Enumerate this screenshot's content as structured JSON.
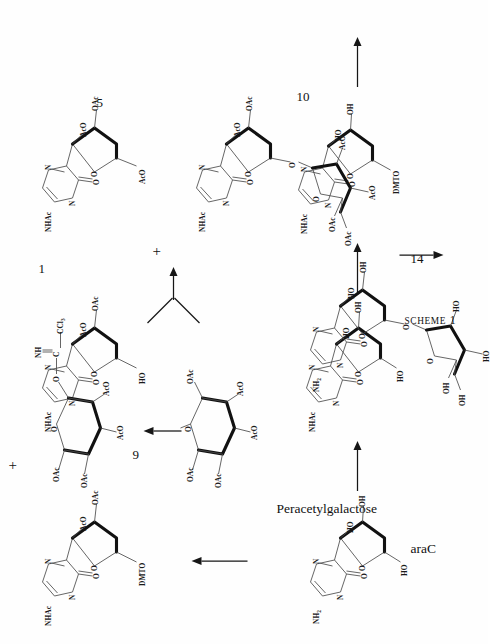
{
  "figure": {
    "caption_small_caps": "SCHEME",
    "caption_number": "1",
    "caption_full": "Scheme 1"
  },
  "compounds": [
    {
      "id": "araC",
      "label": "araC",
      "number": "",
      "base": "cytosine",
      "base_substituent": "NH2",
      "sugar_labels": [
        "HO",
        "OH",
        "HO"
      ]
    },
    {
      "id": "n-acetyl-araC",
      "label": "",
      "number": "",
      "base": "N-acetylcytosine",
      "base_substituent": "NHAc",
      "sugar_labels": [
        "HO",
        "OH",
        "HO"
      ]
    },
    {
      "id": "dmt-n-acetyl-araC",
      "label": "",
      "number": "",
      "base": "N-acetylcytosine",
      "base_substituent": "NHAc",
      "sugar_labels": [
        "HO",
        "OH",
        "DMTO"
      ]
    },
    {
      "id": "diacetyl-dmt",
      "label": "",
      "number": "",
      "base": "N-acetylcytosine",
      "base_substituent": "NHAc",
      "sugar_labels": [
        "AcO",
        "OAc",
        "DMTO"
      ]
    },
    {
      "id": "compound-1",
      "label": "",
      "number": "1",
      "base": "N-acetylcytosine",
      "base_substituent": "NHAc",
      "sugar_labels": [
        "AcO",
        "OAc",
        "HO"
      ]
    },
    {
      "id": "peracetylgalactose",
      "label": "Peracetylgalactose",
      "number": "",
      "sugar_labels": [
        "OAc",
        "OAc",
        "OAc",
        "AcO",
        "AcO"
      ]
    },
    {
      "id": "compound-9",
      "label": "",
      "number": "9",
      "sugar_labels": [
        "OAc",
        "OAc",
        "AcO",
        "AcO"
      ],
      "imidate": {
        "o": "O",
        "c": "C",
        "nh": "NH",
        "ccl3": "CCl3"
      }
    },
    {
      "id": "compound-5",
      "label": "",
      "number": "5",
      "base": "N-acetylcytosine",
      "base_substituent": "NHAc",
      "sugar_labels": [
        "AcO",
        "OAc",
        "AcO"
      ]
    },
    {
      "id": "compound-10",
      "label": "",
      "number": "10",
      "base": "N-acetylcytosine",
      "base_substituent": "NHAc",
      "sugar_labels": [
        "AcO",
        "OAc",
        "O",
        "AcO",
        "OAc",
        "OAc",
        "AcO"
      ]
    },
    {
      "id": "compound-14",
      "label": "",
      "number": "14",
      "base": "cytosine",
      "base_substituent": "NH2",
      "sugar_labels": [
        "HO",
        "OH",
        "O",
        "HO",
        "OH",
        "OH",
        "HO"
      ]
    }
  ],
  "atom_labels": {
    "nh2": "NH",
    "nh2_sub": "2",
    "nhac": "NHAc",
    "n": "N",
    "o": "O",
    "ho": "HO",
    "oh": "OH",
    "aco": "AcO",
    "oac": "OAc",
    "dmto": "DMTO",
    "nh": "NH",
    "c": "C",
    "ccl3": "CCl",
    "ccl3_sub": "3"
  },
  "operators": {
    "plus": "+"
  },
  "colors": {
    "background": "#ffffff",
    "bond": "#4a4a4a",
    "bold_bond": "#111111",
    "text": "#111111",
    "arrow": "#161616"
  }
}
